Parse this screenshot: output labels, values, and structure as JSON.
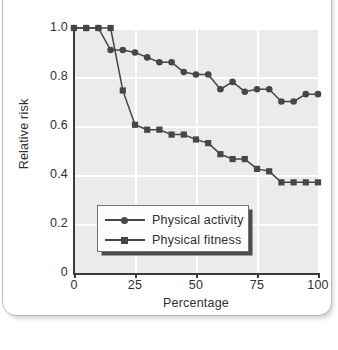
{
  "chart_data": {
    "type": "line",
    "title": "",
    "xlabel": "Percentage",
    "ylabel": "Relative risk",
    "xlim": [
      0,
      100
    ],
    "ylim": [
      0,
      1.0
    ],
    "xticks": [
      "0",
      "25",
      "50",
      "75",
      "100"
    ],
    "xtick_values": [
      0,
      25,
      50,
      75,
      100
    ],
    "yticks": [
      "0",
      "0.2",
      "0.4",
      "0.6",
      "0.8",
      "1.0"
    ],
    "ytick_values": [
      0,
      0.2,
      0.4,
      0.6,
      0.8,
      1.0
    ],
    "grid": true,
    "grid_color": "#ffffff",
    "panel_color": "#ebebeb",
    "legend_position": "lower center",
    "x": [
      0,
      5,
      10,
      15,
      20,
      25,
      30,
      35,
      40,
      45,
      50,
      55,
      60,
      65,
      70,
      75,
      80,
      85,
      90,
      95,
      100
    ],
    "series": [
      {
        "name": "Physical activity",
        "marker": "circle",
        "color": "#44464a",
        "values": [
          1.0,
          1.0,
          1.0,
          0.91,
          0.91,
          0.9,
          0.88,
          0.86,
          0.86,
          0.82,
          0.81,
          0.81,
          0.75,
          0.78,
          0.74,
          0.75,
          0.75,
          0.7,
          0.7,
          0.73,
          0.73
        ]
      },
      {
        "name": "Physical fitness",
        "marker": "square",
        "color": "#44464a",
        "values": [
          1.0,
          1.0,
          1.0,
          1.0,
          0.745,
          0.605,
          0.585,
          0.585,
          0.565,
          0.565,
          0.545,
          0.53,
          0.485,
          0.465,
          0.465,
          0.425,
          0.415,
          0.37,
          0.37,
          0.37,
          0.37
        ]
      }
    ]
  },
  "legend": {
    "items": [
      {
        "label": "Physical activity",
        "marker": "circle"
      },
      {
        "label": "Physical fitness",
        "marker": "square"
      }
    ]
  }
}
